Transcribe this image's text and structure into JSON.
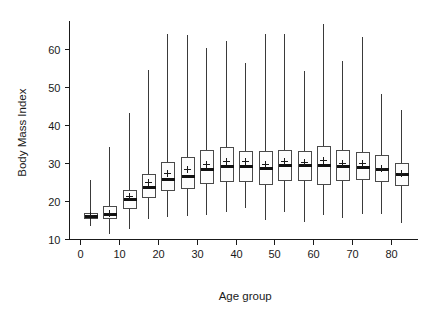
{
  "chart_data": {
    "type": "box",
    "title": "",
    "xlabel": "Age group",
    "ylabel": "Body Mass Index",
    "xlim": [
      0,
      87
    ],
    "ylim": [
      9,
      69
    ],
    "grid": false,
    "legend": "none",
    "x_ticks": [
      0,
      10,
      20,
      30,
      40,
      50,
      60,
      70,
      80
    ],
    "x_tick_labels": [
      "0",
      "10",
      "20",
      "30",
      "40",
      "50",
      "60",
      "70",
      "80"
    ],
    "y_ticks": [
      10,
      20,
      30,
      40,
      50,
      60
    ],
    "y_tick_labels": [
      "10",
      "20",
      "30",
      "40",
      "50",
      "60"
    ],
    "box_width_years": 3.4,
    "marker_note": "plus sign marks the mean, thick horizontal bar marks the median",
    "boxes": [
      {
        "x": 2.5,
        "label": "0-4",
        "whisker_low": 13.6,
        "q1": 15.5,
        "median": 16.1,
        "mean": 16.2,
        "q3": 16.8,
        "whisker_high": 25.9
      },
      {
        "x": 7.5,
        "label": "5-9",
        "whisker_low": 11.5,
        "q1": 15.5,
        "median": 16.5,
        "mean": 16.9,
        "q3": 18.6,
        "whisker_high": 34.5
      },
      {
        "x": 12.5,
        "label": "10-14",
        "whisker_low": 12.8,
        "q1": 18.2,
        "median": 20.5,
        "mean": 21.3,
        "q3": 22.9,
        "whisker_high": 43.3
      },
      {
        "x": 17.5,
        "label": "15-19",
        "whisker_low": 15.4,
        "q1": 21.1,
        "median": 23.8,
        "mean": 24.9,
        "q3": 27.1,
        "whisker_high": 54.7
      },
      {
        "x": 22.5,
        "label": "20-24",
        "whisker_low": 16.0,
        "q1": 22.8,
        "median": 25.8,
        "mean": 27.4,
        "q3": 30.3,
        "whisker_high": 64.2
      },
      {
        "x": 27.5,
        "label": "25-29",
        "whisker_low": 16.4,
        "q1": 23.3,
        "median": 26.5,
        "mean": 28.3,
        "q3": 31.7,
        "whisker_high": 63.9
      },
      {
        "x": 32.5,
        "label": "30-34",
        "whisker_low": 16.6,
        "q1": 24.7,
        "median": 28.3,
        "mean": 29.8,
        "q3": 33.4,
        "whisker_high": 60.5
      },
      {
        "x": 37.5,
        "label": "35-39",
        "whisker_low": 17.3,
        "q1": 25.2,
        "median": 29.2,
        "mean": 30.4,
        "q3": 34.3,
        "whisker_high": 62.5
      },
      {
        "x": 42.5,
        "label": "40-44",
        "whisker_low": 18.4,
        "q1": 25.2,
        "median": 29.3,
        "mean": 30.4,
        "q3": 33.2,
        "whisker_high": 56.7
      },
      {
        "x": 47.5,
        "label": "45-49",
        "whisker_low": 15.2,
        "q1": 24.6,
        "median": 28.7,
        "mean": 29.7,
        "q3": 33.2,
        "whisker_high": 64.2
      },
      {
        "x": 52.5,
        "label": "50-54",
        "whisker_low": 17.4,
        "q1": 25.4,
        "median": 29.4,
        "mean": 30.6,
        "q3": 33.5,
        "whisker_high": 64.2
      },
      {
        "x": 57.5,
        "label": "55-59",
        "whisker_low": 14.7,
        "q1": 25.4,
        "median": 29.4,
        "mean": 30.3,
        "q3": 33.1,
        "whisker_high": 54.6
      },
      {
        "x": 62.5,
        "label": "60-64",
        "whisker_low": 16.5,
        "q1": 24.4,
        "median": 29.4,
        "mean": 30.9,
        "q3": 34.4,
        "whisker_high": 66.8
      },
      {
        "x": 67.5,
        "label": "65-69",
        "whisker_low": 15.9,
        "q1": 25.6,
        "median": 29.3,
        "mean": 30.1,
        "q3": 33.5,
        "whisker_high": 57.1
      },
      {
        "x": 72.5,
        "label": "70-74",
        "whisker_low": 16.9,
        "q1": 25.9,
        "median": 29.0,
        "mean": 29.9,
        "q3": 32.9,
        "whisker_high": 63.3
      },
      {
        "x": 77.5,
        "label": "75-79",
        "whisker_low": 16.9,
        "q1": 25.2,
        "median": 28.5,
        "mean": 28.8,
        "q3": 32.2,
        "whisker_high": 48.3
      },
      {
        "x": 82.5,
        "label": "80+",
        "whisker_low": 14.5,
        "q1": 24.2,
        "median": 27.0,
        "mean": 27.3,
        "q3": 30.0,
        "whisker_high": 44.3
      }
    ]
  }
}
